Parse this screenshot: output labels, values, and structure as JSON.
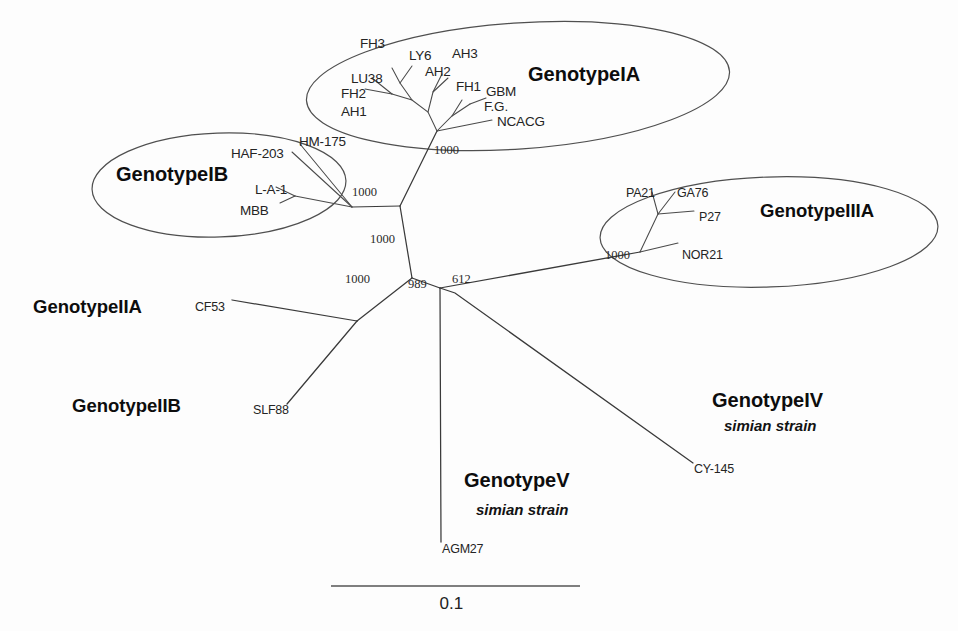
{
  "figure": {
    "type": "phylogenetic-tree",
    "layout": "unrooted-radial",
    "scale_bar": {
      "label": "0.1",
      "value": 0.1,
      "units": "substitutions per site",
      "x_start": 331,
      "x_end": 580,
      "y": 586
    }
  },
  "groups": [
    {
      "id": "IA",
      "label": "GenotypeIA",
      "label_x": 528,
      "label_y": 63,
      "ellipse": {
        "cx": 518,
        "cy": 86,
        "rx": 212,
        "ry": 63,
        "rotate": -4
      },
      "taxa": [
        "FH3",
        "LY6",
        "AH3",
        "LU38",
        "AH2",
        "FH1",
        "GBM",
        "FH2",
        "F.G.",
        "AH1",
        "NCACG"
      ]
    },
    {
      "id": "IB",
      "label": "GenotypeIB",
      "label_x": 116,
      "label_y": 163,
      "ellipse": {
        "cx": 219,
        "cy": 185,
        "rx": 127,
        "ry": 52,
        "rotate": -2
      },
      "taxa": [
        "HAF-203",
        "HM-175",
        "L-A-1",
        "MBB"
      ]
    },
    {
      "id": "IIIA",
      "label": "GenotypeIIIA",
      "label_x": 760,
      "label_y": 200,
      "ellipse": {
        "cx": 769,
        "cy": 232,
        "rx": 169,
        "ry": 55,
        "rotate": -2
      },
      "taxa": [
        "PA21",
        "GA76",
        "P27",
        "NOR21"
      ]
    },
    {
      "id": "IIA",
      "label": "GenotypeIIA",
      "label_x": 33,
      "label_y": 296,
      "ellipse": null,
      "taxa": [
        "CF53"
      ]
    },
    {
      "id": "IIB",
      "label": "GenotypeIIB",
      "label_x": 72,
      "label_y": 395,
      "ellipse": null,
      "taxa": [
        "SLF88"
      ]
    },
    {
      "id": "IV",
      "label": "GenotypeIV",
      "sublabel": "simian strain",
      "label_x": 712,
      "label_y": 389,
      "sublabel_x": 724,
      "sublabel_y": 417,
      "ellipse": null,
      "taxa": [
        "CY-145"
      ]
    },
    {
      "id": "V",
      "label": "GenotypeV",
      "sublabel": "simian strain",
      "label_x": 464,
      "label_y": 469,
      "sublabel_x": 476,
      "sublabel_y": 501,
      "ellipse": null,
      "taxa": [
        "AGM27"
      ]
    }
  ],
  "taxa_labels": [
    {
      "name": "FH3",
      "x": 360,
      "y": 36,
      "size": "normal"
    },
    {
      "name": "LY6",
      "x": 409,
      "y": 48,
      "size": "normal"
    },
    {
      "name": "AH3",
      "x": 452,
      "y": 46,
      "size": "normal"
    },
    {
      "name": "LU38",
      "x": 351,
      "y": 71,
      "size": "normal"
    },
    {
      "name": "AH2",
      "x": 425,
      "y": 64,
      "size": "normal"
    },
    {
      "name": "FH1",
      "x": 456,
      "y": 79,
      "size": "normal"
    },
    {
      "name": "GBM",
      "x": 486,
      "y": 84,
      "size": "normal"
    },
    {
      "name": "FH2",
      "x": 341,
      "y": 86,
      "size": "normal"
    },
    {
      "name": "F.G.",
      "x": 484,
      "y": 99,
      "size": "normal"
    },
    {
      "name": "AH1",
      "x": 341,
      "y": 104,
      "size": "normal"
    },
    {
      "name": "NCACG",
      "x": 497,
      "y": 114,
      "size": "normal"
    },
    {
      "name": "HAF-203",
      "x": 231,
      "y": 146,
      "size": "normal"
    },
    {
      "name": "HM-175",
      "x": 299,
      "y": 134,
      "size": "normal"
    },
    {
      "name": "L-A-1",
      "x": 255,
      "y": 182,
      "size": "normal"
    },
    {
      "name": "MBB",
      "x": 240,
      "y": 203,
      "size": "normal"
    },
    {
      "name": "PA21",
      "x": 626,
      "y": 186,
      "size": "small"
    },
    {
      "name": "GA76",
      "x": 677,
      "y": 186,
      "size": "small"
    },
    {
      "name": "P27",
      "x": 699,
      "y": 210,
      "size": "small"
    },
    {
      "name": "NOR21",
      "x": 682,
      "y": 248,
      "size": "small"
    },
    {
      "name": "CF53",
      "x": 195,
      "y": 300,
      "size": "small"
    },
    {
      "name": "SLF88",
      "x": 253,
      "y": 403,
      "size": "small"
    },
    {
      "name": "CY-145",
      "x": 694,
      "y": 462,
      "size": "small"
    },
    {
      "name": "AGM27",
      "x": 442,
      "y": 542,
      "size": "small"
    }
  ],
  "bootstrap_values": [
    {
      "value": "1000",
      "x": 434,
      "y": 143
    },
    {
      "value": "1000",
      "x": 352,
      "y": 185
    },
    {
      "value": "1000",
      "x": 370,
      "y": 232
    },
    {
      "value": "1000",
      "x": 345,
      "y": 272
    },
    {
      "value": "989",
      "x": 408,
      "y": 277
    },
    {
      "value": "612",
      "x": 452,
      "y": 272
    },
    {
      "value": "1000",
      "x": 605,
      "y": 248
    }
  ],
  "branches": {
    "ia_cluster": [
      "M 437 131 L 428 112 L 412 100 L 392 94",
      "M 392 94 L 365 89",
      "M 392 94 L 372 78",
      "M 412 100 L 400 83 L 392 68",
      "M 400 83 L 412 66",
      "M 428 112 L 433 92 L 442 74",
      "M 433 92 L 448 78",
      "M 437 131 L 452 116 L 470 104",
      "M 452 116 L 462 100",
      "M 470 104 L 486 98",
      "M 437 131 L 462 126 L 492 120"
    ],
    "backbone": [
      "M 437 131 L 400 206",
      "M 400 206 L 352 207",
      "M 400 206 L 412 278",
      "M 412 278 L 440 288",
      "M 440 288 L 441 542",
      "M 440 288 L 455 293 L 693 463",
      "M 440 288 L 640 252",
      "M 412 278 L 357 321",
      "M 357 321 L 232 300",
      "M 357 321 L 287 404"
    ],
    "ib_cluster": [
      "M 352 207 L 300 144",
      "M 352 207 L 292 152",
      "M 352 207 L 295 196",
      "M 295 196 L 276 187",
      "M 295 196 L 280 203"
    ],
    "iiia_cluster": [
      "M 640 252 L 658 214",
      "M 658 214 L 652 192",
      "M 658 214 L 675 192",
      "M 658 214 L 694 211",
      "M 640 252 L 678 243"
    ]
  }
}
